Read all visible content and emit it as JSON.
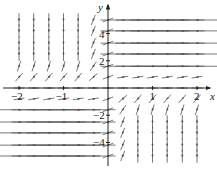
{
  "chart_data": {
    "type": "vector_field",
    "title": "",
    "xlabel": "x",
    "ylabel": "y",
    "xlim": [
      -2.3,
      2.3
    ],
    "ylim": [
      -5.5,
      6.5
    ],
    "x_ticks": [
      {
        "value": -2,
        "label": "−2"
      },
      {
        "value": -1,
        "label": "−1"
      },
      {
        "value": 1,
        "label": "1"
      },
      {
        "value": 2,
        "label": "2"
      }
    ],
    "y_ticks": [
      {
        "value": 4,
        "label": "4"
      },
      {
        "value": 2,
        "label": "2"
      },
      {
        "value": -2,
        "label": "−2"
      },
      {
        "value": -4,
        "label": "−4"
      }
    ],
    "grid": false,
    "field": {
      "x_samples": [
        -2,
        -1.67,
        -1.33,
        -1,
        -0.67,
        -0.33,
        0,
        0.33,
        0.67,
        1,
        1.33,
        1.67,
        2
      ],
      "y_samples": [
        5,
        4.2,
        3.3,
        2.5,
        1.6,
        0.8,
        0,
        -0.8,
        -1.6,
        -2.5,
        -3.3,
        -4.2,
        -5
      ],
      "rule_q1": "right",
      "rule_q2": "up",
      "rule_q3": "right",
      "rule_q4": "up"
    },
    "colors": {
      "axis": "#222222",
      "arrow": "#555555",
      "label": "#222222"
    }
  },
  "axis_labels": {
    "x": "x",
    "y": "y"
  }
}
